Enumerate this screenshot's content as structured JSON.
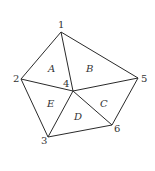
{
  "diagram": {
    "type": "triangulated-pentagon",
    "vertices": [
      {
        "id": "1",
        "label": "1",
        "x": 61,
        "y": 32,
        "lx": 58,
        "ly": 28
      },
      {
        "id": "2",
        "label": "2",
        "x": 21,
        "y": 79,
        "lx": 13,
        "ly": 82
      },
      {
        "id": "3",
        "label": "3",
        "x": 48,
        "y": 137,
        "lx": 41,
        "ly": 144
      },
      {
        "id": "4",
        "label": "4",
        "x": 73,
        "y": 91,
        "lx": 63,
        "ly": 87
      },
      {
        "id": "5",
        "label": "5",
        "x": 138,
        "y": 78,
        "lx": 141,
        "ly": 82
      },
      {
        "id": "6",
        "label": "6",
        "x": 112,
        "y": 125,
        "lx": 114,
        "ly": 132
      }
    ],
    "edges": [
      [
        "1",
        "2"
      ],
      [
        "1",
        "5"
      ],
      [
        "2",
        "3"
      ],
      [
        "3",
        "6"
      ],
      [
        "6",
        "5"
      ],
      [
        "1",
        "4"
      ],
      [
        "2",
        "4"
      ],
      [
        "3",
        "4"
      ],
      [
        "4",
        "5"
      ],
      [
        "4",
        "6"
      ]
    ],
    "regions": [
      {
        "id": "A",
        "label": "A",
        "x": 48,
        "y": 72
      },
      {
        "id": "B",
        "label": "B",
        "x": 86,
        "y": 72
      },
      {
        "id": "C",
        "label": "C",
        "x": 100,
        "y": 107
      },
      {
        "id": "D",
        "label": "D",
        "x": 74,
        "y": 120
      },
      {
        "id": "E",
        "label": "E",
        "x": 47,
        "y": 107
      }
    ]
  }
}
